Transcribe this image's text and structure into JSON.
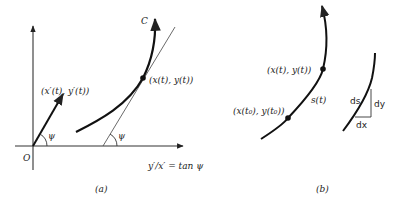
{
  "figure": {
    "panel_a": {
      "caption": "(a)",
      "origin_label": "O",
      "curve_label": "C",
      "point_label": "(x(t), y(t))",
      "velocity_label": "(x′(t), y′(t))",
      "angle_label_vector": "ψ",
      "angle_label_tangent": "ψ",
      "slope_label": "y′/x′ = tan ψ"
    },
    "panel_b": {
      "caption": "(b)",
      "point_label": "(x(t), y(t))",
      "start_point_label": "(x(t₀), y(t₀))",
      "arc_length_label": "s(t)",
      "ds_label": "ds",
      "dy_label": "dy",
      "dx_label": "dx"
    },
    "colors": {
      "ink": "#222222",
      "background": "#ffffff"
    }
  }
}
